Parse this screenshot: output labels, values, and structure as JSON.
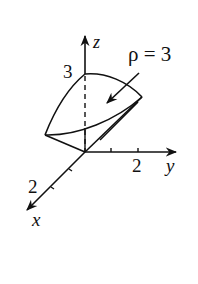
{
  "diagram": {
    "type": "3d-region-sketch",
    "axes": {
      "z": {
        "label": "z",
        "tick_label": "3"
      },
      "y": {
        "label": "y",
        "tick_label": "2"
      },
      "x": {
        "label": "x",
        "tick_label": "2"
      }
    },
    "annotation": {
      "text": "ρ = 3"
    },
    "colors": {
      "stroke": "#111111",
      "background": "#ffffff"
    }
  }
}
